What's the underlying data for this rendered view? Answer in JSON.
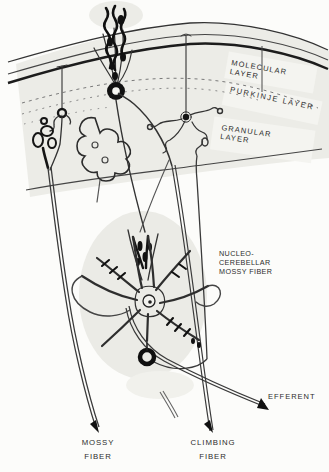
{
  "labels": {
    "molecular_layer": {
      "line1": "MOLECULAR",
      "line2": "LAYER"
    },
    "purkinje_layer": {
      "line": "PURKINJE LAYER"
    },
    "granular_layer": {
      "line1": "GRANULAR",
      "line2": "LAYER"
    },
    "nucleo_cerebellar_mossy_fiber": {
      "line1": "NUCLEO-",
      "line2": "CEREBELLAR",
      "line3": "MOSSY FIBER"
    },
    "efferent": {
      "line": "EFFERENT"
    },
    "mossy_fiber": {
      "line1": "MOSSY",
      "line2": "FIBER"
    },
    "climbing_fiber": {
      "line1": "CLIMBING",
      "line2": "FIBER"
    }
  },
  "colors": {
    "paper": "#FCFCFA",
    "wash": "#ECECE7",
    "label_patch": "#F4F4F0",
    "ink": "#333333",
    "ink_dark": "#121212",
    "label_text": "#2C2C2C"
  }
}
